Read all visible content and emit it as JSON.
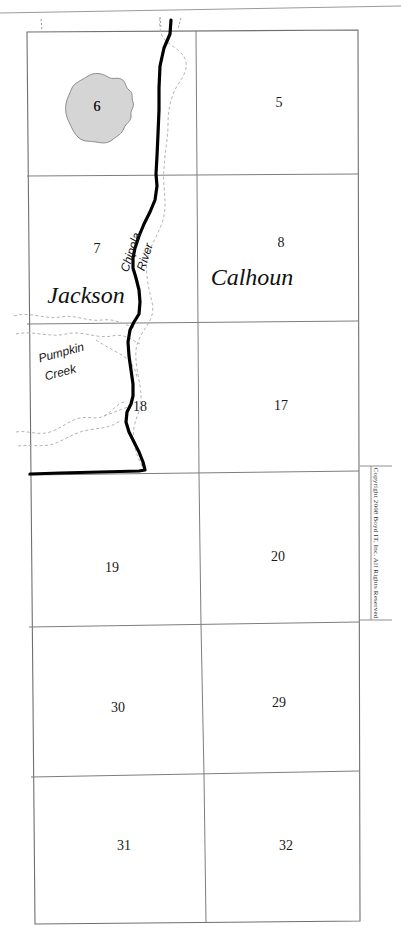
{
  "map": {
    "title": "Township section map",
    "counties": [
      {
        "name": "Jackson",
        "x": 86,
        "y": 297
      },
      {
        "name": "Calhoun",
        "x": 252,
        "y": 279
      }
    ],
    "hydrography": [
      {
        "name": "Chipola River",
        "type": "river",
        "label_line1": "Chipola",
        "label_line2": "River"
      },
      {
        "name": "Pumpkin Creek",
        "type": "creek",
        "label_line1": "Pumpkin",
        "label_line2": "Creek"
      }
    ],
    "sections": [
      {
        "number": "6",
        "x": 97,
        "y": 108
      },
      {
        "number": "5",
        "x": 279,
        "y": 104
      },
      {
        "number": "7",
        "x": 97,
        "y": 250
      },
      {
        "number": "8",
        "x": 281,
        "y": 244
      },
      {
        "number": "18",
        "x": 140,
        "y": 408
      },
      {
        "number": "17",
        "x": 281,
        "y": 407
      },
      {
        "number": "19",
        "x": 112,
        "y": 569
      },
      {
        "number": "20",
        "x": 278,
        "y": 558
      },
      {
        "number": "30",
        "x": 118,
        "y": 709
      },
      {
        "number": "29",
        "x": 279,
        "y": 704
      },
      {
        "number": "31",
        "x": 124,
        "y": 847
      },
      {
        "number": "32",
        "x": 286,
        "y": 847
      }
    ],
    "lakes": [
      {
        "label": "6",
        "fill": "#d5d5d5"
      }
    ],
    "copyright": "Copyright 2008 Boyd IT, Inc. All Rights Reserved",
    "colors": {
      "grid": "#7d7d7d",
      "boundary": "#000000",
      "stream": "#b4b4b4",
      "lake_fill": "#d5d5d5",
      "background": "#ffffff"
    }
  }
}
